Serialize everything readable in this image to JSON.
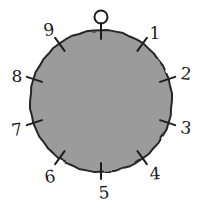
{
  "figure": {
    "kind": "dial-diagram",
    "background_color": "#ffffff"
  },
  "dial": {
    "fill_color": "#9b9b9b",
    "outline_color": "#262626",
    "outline_width": 2,
    "center_x": 101,
    "center_y": 101,
    "radius": 71,
    "tick_count": 10,
    "tick_color": "#1f1f1f",
    "tick_width": 2,
    "zero_marker_shape": "small-open-circle",
    "zero_marker_color": "#1f1f1f"
  },
  "chart_data": {
    "type": "pie",
    "title": "",
    "subtitle": "",
    "xlabel": "",
    "ylabel": "",
    "legend_position": "none",
    "grid": false,
    "categories": [
      "0",
      "1",
      "2",
      "3",
      "4",
      "5",
      "6",
      "7",
      "8",
      "9"
    ],
    "values": [
      10,
      10,
      10,
      10,
      10,
      10,
      10,
      10,
      10,
      10
    ],
    "annotations": [
      "ticks at every 36 degrees, numbered 0-9 clockwise from top"
    ]
  },
  "ticks": [
    {
      "label": "0",
      "angle_deg": 0,
      "label_x": 101,
      "label_y": 14,
      "slant": ""
    },
    {
      "label": "1",
      "angle_deg": 36,
      "label_x": 155,
      "label_y": 33,
      "slant": ""
    },
    {
      "label": "2",
      "angle_deg": 72,
      "label_x": 186,
      "label_y": 74,
      "slant": "slant-b"
    },
    {
      "label": "3",
      "angle_deg": 108,
      "label_x": 186,
      "label_y": 128,
      "slant": "slant-b"
    },
    {
      "label": "4",
      "angle_deg": 144,
      "label_x": 155,
      "label_y": 174,
      "slant": "slant-c"
    },
    {
      "label": "5",
      "angle_deg": 180,
      "label_x": 104,
      "label_y": 193,
      "slant": "slant-c"
    },
    {
      "label": "6",
      "angle_deg": 216,
      "label_x": 50,
      "label_y": 177,
      "slant": "slant-a"
    },
    {
      "label": "7",
      "angle_deg": 252,
      "label_x": 17,
      "label_y": 130,
      "slant": "slant-a"
    },
    {
      "label": "8",
      "angle_deg": 288,
      "label_x": 17,
      "label_y": 76,
      "slant": ""
    },
    {
      "label": "9",
      "angle_deg": 324,
      "label_x": 49,
      "label_y": 30,
      "slant": "slant-a"
    }
  ]
}
